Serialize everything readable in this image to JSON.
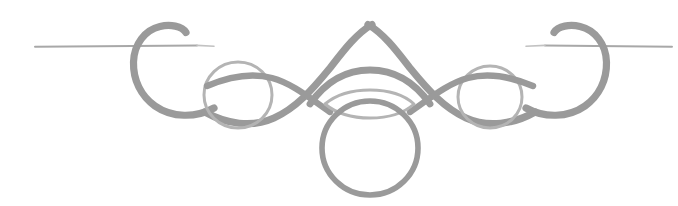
{
  "page": {
    "width": 678,
    "height": 206,
    "background_color": "#ffffff"
  },
  "colors": {
    "ink": "#9a9a9a",
    "ink_light": "#b4b4b4",
    "ink_lighter": "#c2c2c2",
    "rule": "#a8a8a8",
    "background": "#ffffff"
  },
  "geometry": {
    "center_x": 370,
    "rule_y": 46,
    "left_rule_start_x": 35,
    "left_rule_end_x": 197,
    "right_rule_start_x": 545,
    "right_rule_end_x": 672,
    "arch_apex_x": 372,
    "arch_apex_y": 23,
    "inner_arch_apex_y": 70,
    "left_loop_center_x": 238,
    "left_loop_center_y": 95,
    "left_loop_radius": 33,
    "right_loop_center_x": 490,
    "right_loop_center_y": 97,
    "right_loop_radius": 31,
    "oval_center_x": 370,
    "oval_center_y": 148,
    "oval_radius_x": 48,
    "oval_radius_y": 47,
    "lens_left_x": 325,
    "lens_right_x": 392,
    "lens_center_y": 103,
    "left_curl_left_x": 133,
    "left_curl_right_x": 188,
    "left_curl_top_y": 28,
    "left_curl_bottom_y": 110,
    "stroke_width_thick": 7,
    "stroke_width_thin": 3,
    "stroke_width_rule": 2
  },
  "elements": {
    "left_rule_label": "left horizontal rule",
    "right_rule_label": "right horizontal rule",
    "left_curl_label": "left scroll curl",
    "right_curl_label": "right scroll curl",
    "left_loop_label": "left circular loop",
    "right_loop_label": "right circular loop",
    "arch_label": "central peaked arch",
    "inner_arch_label": "inner arch",
    "lens_label": "central lens shape",
    "oval_label": "hanging oval pendant"
  }
}
